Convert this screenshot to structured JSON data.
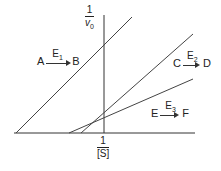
{
  "diagram": {
    "y_axis": {
      "numerator": "1",
      "denominator": "v",
      "denominator_sub": "0"
    },
    "x_axis": {
      "numerator": "1",
      "denominator": "[S]"
    },
    "reactions": [
      {
        "substrate": "A",
        "enzyme": "E",
        "enzyme_sub": "1",
        "product": "B"
      },
      {
        "substrate": "C",
        "enzyme": "E",
        "enzyme_sub": "2",
        "product": "D"
      },
      {
        "substrate": "E",
        "enzyme": "E",
        "enzyme_sub": "3",
        "product": "F"
      }
    ],
    "lines": [
      {
        "name": "E1",
        "x1": 16,
        "y1": 133,
        "x2": 132,
        "y2": 17
      },
      {
        "name": "E2",
        "x1": 81,
        "y1": 133,
        "x2": 193,
        "y2": 34
      },
      {
        "name": "E3",
        "x1": 69,
        "y1": 133,
        "x2": 193,
        "y2": 79
      }
    ],
    "colors": {
      "line": "#444444",
      "axis": "#333333"
    }
  }
}
